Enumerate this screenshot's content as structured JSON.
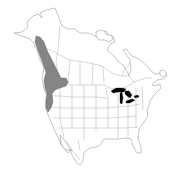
{
  "map": {
    "type": "species-range-map",
    "region": "North America",
    "colors": {
      "background": "#ffffff",
      "outline": "#8a8a8a",
      "lakes": "#000000",
      "range_hatch": "#333333"
    },
    "features": [
      {
        "name": "range",
        "description": "Pacific coastal range from southeast Alaska through British Columbia, Washington, Oregon to northern California",
        "style": "cross-hatched"
      },
      {
        "name": "great-lakes",
        "style": "solid black"
      }
    ]
  }
}
